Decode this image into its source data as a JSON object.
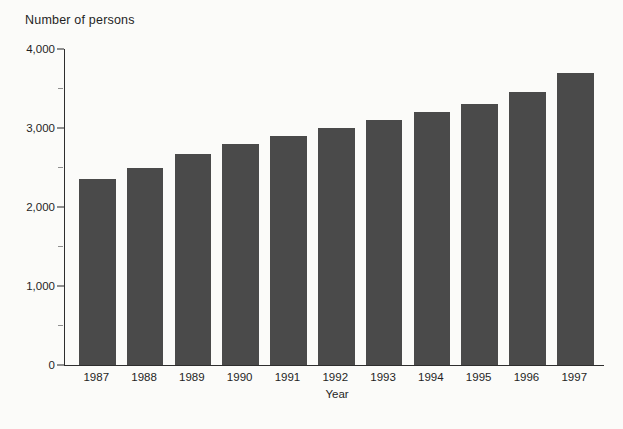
{
  "chart_data": {
    "type": "bar",
    "title": "Number of persons",
    "xlabel": "Year",
    "ylabel": "Number of persons",
    "categories": [
      "1987",
      "1988",
      "1989",
      "1990",
      "1991",
      "1992",
      "1993",
      "1994",
      "1995",
      "1996",
      "1997"
    ],
    "values": [
      2350,
      2500,
      2675,
      2800,
      2900,
      3000,
      3100,
      3200,
      3300,
      3450,
      3700
    ],
    "ylim": [
      0,
      4000
    ],
    "y_major_ticks": [
      {
        "value": 0,
        "label": "0"
      },
      {
        "value": 1000,
        "label": "1,000"
      },
      {
        "value": 2000,
        "label": "2,000"
      },
      {
        "value": 3000,
        "label": "3,000"
      },
      {
        "value": 4000,
        "label": "4,000"
      }
    ],
    "y_minor_tick_values": [
      500,
      1500,
      2500,
      3500
    ],
    "grid": false,
    "legend": false,
    "colors": {
      "bar": "#4a4a4a",
      "axis": "#2e2e2e",
      "tick": "#8f8f8f",
      "text": "#1f1f1f",
      "background": "#fbfbf9"
    }
  }
}
